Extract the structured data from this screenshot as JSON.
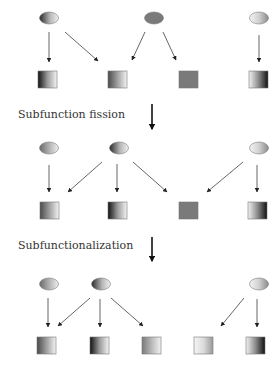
{
  "labels": {
    "fission": "Subfunction fission",
    "subfunctionalization": "Subfunctionalization"
  },
  "colors": {
    "arrow": "#555555",
    "stage_arrow": "#111111",
    "box_stroke": "#777777",
    "ellipse_stroke": "#777777",
    "solid_gray": "#7a7a7a",
    "label": "#333333"
  },
  "stages": [
    {
      "name": "ancestral",
      "regulators": [
        {
          "id": "r1",
          "cx": 49,
          "cy": 18,
          "fill": "gradDarkLeft"
        },
        {
          "id": "r2",
          "cx": 154,
          "cy": 18,
          "fill": "solidGray"
        },
        {
          "id": "r3",
          "cx": 259,
          "cy": 18,
          "fill": "gradLight"
        }
      ],
      "targets": [
        {
          "id": "t1",
          "x": 38,
          "y": 71,
          "fill": "boxDarkLeft"
        },
        {
          "id": "t2",
          "x": 108,
          "y": 71,
          "fill": "boxDarkLeftSoft"
        },
        {
          "id": "t3",
          "x": 179,
          "y": 71,
          "fill": "solidGray"
        },
        {
          "id": "t4",
          "x": 249,
          "y": 71,
          "fill": "boxDarkRight"
        }
      ],
      "edges": [
        {
          "x1": 49,
          "y1": 32,
          "x2": 49,
          "y2": 62
        },
        {
          "x1": 65,
          "y1": 32,
          "x2": 98,
          "y2": 61
        },
        {
          "x1": 145,
          "y1": 32,
          "x2": 132,
          "y2": 60
        },
        {
          "x1": 163,
          "y1": 32,
          "x2": 176,
          "y2": 60
        },
        {
          "x1": 259,
          "y1": 35,
          "x2": 259,
          "y2": 62
        }
      ]
    },
    {
      "name": "after-fission",
      "regulators": [
        {
          "id": "r1",
          "cx": 49,
          "cy": 148,
          "fill": "gradGrayLeft"
        },
        {
          "id": "r2",
          "cx": 119,
          "cy": 148,
          "fill": "gradDarkLeft"
        },
        {
          "id": "r3",
          "cx": 259,
          "cy": 148,
          "fill": "gradLight"
        }
      ],
      "targets": [
        {
          "id": "t1",
          "x": 40,
          "y": 202,
          "fill": "boxDarkLeftSoft"
        },
        {
          "id": "t2",
          "x": 108,
          "y": 202,
          "fill": "boxDarkLeft"
        },
        {
          "id": "t3",
          "x": 179,
          "y": 202,
          "fill": "solidGray"
        },
        {
          "id": "t4",
          "x": 248,
          "y": 202,
          "fill": "boxDarkRight"
        }
      ],
      "edges": [
        {
          "x1": 49,
          "y1": 165,
          "x2": 49,
          "y2": 192
        },
        {
          "x1": 102,
          "y1": 162,
          "x2": 68,
          "y2": 192
        },
        {
          "x1": 117,
          "y1": 164,
          "x2": 117,
          "y2": 192
        },
        {
          "x1": 133,
          "y1": 162,
          "x2": 167,
          "y2": 192
        },
        {
          "x1": 243,
          "y1": 162,
          "x2": 207,
          "y2": 192
        },
        {
          "x1": 257,
          "y1": 165,
          "x2": 257,
          "y2": 192
        }
      ]
    },
    {
      "name": "after-subfunctionalization",
      "regulators": [
        {
          "id": "r1",
          "cx": 49,
          "cy": 284,
          "fill": "gradGrayLeft"
        },
        {
          "id": "r2",
          "cx": 101,
          "cy": 284,
          "fill": "gradDarkLeft"
        },
        {
          "id": "r3",
          "cx": 259,
          "cy": 284,
          "fill": "gradLight"
        }
      ],
      "targets": [
        {
          "id": "t1",
          "x": 37,
          "y": 337,
          "fill": "boxDarkLeftSoft"
        },
        {
          "id": "t2",
          "x": 90,
          "y": 337,
          "fill": "boxDarkLeft"
        },
        {
          "id": "t3",
          "x": 142,
          "y": 337,
          "fill": "boxGrayLeft"
        },
        {
          "id": "t4",
          "x": 194,
          "y": 337,
          "fill": "boxLightLeft"
        },
        {
          "id": "t5",
          "x": 246,
          "y": 337,
          "fill": "boxDarkRight"
        }
      ],
      "edges": [
        {
          "x1": 48,
          "y1": 298,
          "x2": 48,
          "y2": 327
        },
        {
          "x1": 90,
          "y1": 298,
          "x2": 58,
          "y2": 326
        },
        {
          "x1": 100,
          "y1": 299,
          "x2": 100,
          "y2": 327
        },
        {
          "x1": 111,
          "y1": 298,
          "x2": 143,
          "y2": 326
        },
        {
          "x1": 244,
          "y1": 298,
          "x2": 221,
          "y2": 326
        },
        {
          "x1": 257,
          "y1": 299,
          "x2": 257,
          "y2": 327
        }
      ]
    }
  ],
  "stage_arrows": [
    {
      "x": 152,
      "y1": 104,
      "y2": 129
    },
    {
      "x": 152,
      "y1": 237,
      "y2": 261
    }
  ]
}
